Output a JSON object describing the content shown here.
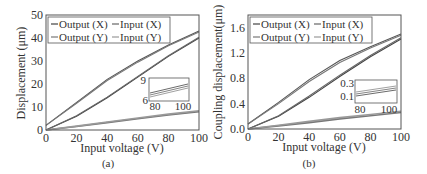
{
  "chart_data": [
    {
      "type": "line",
      "panel_label": "(a)",
      "title": "",
      "xlabel": "Input voltage (V)",
      "ylabel": "Displacement (μm)",
      "xlim": [
        0,
        100
      ],
      "ylim": [
        0,
        50
      ],
      "xticks": [
        "0",
        "20",
        "40",
        "60",
        "80",
        "100"
      ],
      "yticks": [
        "0",
        "10",
        "20",
        "30",
        "40",
        "50"
      ],
      "legend": {
        "position": "upper left",
        "entries": [
          "Output (X)",
          "Input (X)",
          "Output (Y)",
          "Input (Y)"
        ]
      },
      "series": [
        {
          "name": "Output (X) ascending",
          "x": [
            0,
            20,
            40,
            60,
            80,
            100
          ],
          "values": [
            0,
            6,
            14,
            23,
            32,
            40
          ]
        },
        {
          "name": "Output (X) descending",
          "x": [
            0,
            20,
            40,
            60,
            80,
            100
          ],
          "values": [
            2,
            12,
            22,
            30,
            37,
            43
          ]
        },
        {
          "name": "Input (X) ascending",
          "x": [
            0,
            20,
            40,
            60,
            80,
            100
          ],
          "values": [
            0,
            6.2,
            14.3,
            23.3,
            32.3,
            40.3
          ]
        },
        {
          "name": "Input (X) descending",
          "x": [
            0,
            20,
            40,
            60,
            80,
            100
          ],
          "values": [
            2,
            11.6,
            21.5,
            29.5,
            36.6,
            42.6
          ]
        },
        {
          "name": "Output (Y)",
          "x": [
            0,
            20,
            40,
            60,
            80,
            100
          ],
          "values": [
            0,
            1.5,
            3.2,
            4.9,
            6.5,
            8
          ]
        },
        {
          "name": "Input (Y)",
          "x": [
            0,
            20,
            40,
            60,
            80,
            100
          ],
          "values": [
            0,
            1.7,
            3.5,
            5.2,
            6.9,
            8.4
          ]
        }
      ],
      "inset": {
        "xlim": [
          80,
          100
        ],
        "ylim": [
          6,
          9
        ],
        "xticks": [
          "80",
          "100"
        ],
        "yticks": [
          "6",
          "9"
        ]
      }
    },
    {
      "type": "line",
      "panel_label": "(b)",
      "title": "",
      "xlabel": "Input voltage (V)",
      "ylabel": "Coupling displacement(μm)",
      "xlim": [
        0,
        100
      ],
      "ylim": [
        0,
        1.8
      ],
      "xticks": [
        "0",
        "20",
        "40",
        "60",
        "80",
        "100"
      ],
      "yticks": [
        "0.0",
        "0.4",
        "0.8",
        "1.2",
        "1.6"
      ],
      "legend": {
        "position": "upper left",
        "entries": [
          "Output (X)",
          "Input (X)",
          "Output (Y)",
          "Input (Y)"
        ]
      },
      "series": [
        {
          "name": "Output (X) ascending",
          "x": [
            0,
            20,
            40,
            60,
            80,
            100
          ],
          "values": [
            0,
            0.2,
            0.5,
            0.83,
            1.14,
            1.42
          ]
        },
        {
          "name": "Output (X) descending",
          "x": [
            0,
            20,
            40,
            60,
            80,
            100
          ],
          "values": [
            0.08,
            0.42,
            0.78,
            1.08,
            1.3,
            1.5
          ]
        },
        {
          "name": "Input (X) ascending",
          "x": [
            0,
            20,
            40,
            60,
            80,
            100
          ],
          "values": [
            0,
            0.21,
            0.52,
            0.85,
            1.16,
            1.44
          ]
        },
        {
          "name": "Input (X) descending",
          "x": [
            0,
            20,
            40,
            60,
            80,
            100
          ],
          "values": [
            0.08,
            0.4,
            0.75,
            1.05,
            1.28,
            1.48
          ]
        },
        {
          "name": "Output (Y)",
          "x": [
            0,
            20,
            40,
            60,
            80,
            100
          ],
          "values": [
            0,
            0.05,
            0.1,
            0.16,
            0.21,
            0.26
          ]
        },
        {
          "name": "Input (Y)",
          "x": [
            0,
            20,
            40,
            60,
            80,
            100
          ],
          "values": [
            0,
            0.06,
            0.12,
            0.18,
            0.23,
            0.28
          ]
        }
      ],
      "inset": {
        "xlim": [
          80,
          100
        ],
        "ylim": [
          0.1,
          0.3
        ],
        "xticks": [
          "80",
          "100"
        ],
        "yticks": [
          "0.1",
          "0.3"
        ]
      }
    }
  ],
  "colors": {
    "axis": "#555555",
    "line_dark": "#444444",
    "line_mid": "#666666",
    "line_light": "#888888",
    "text": "#333333"
  }
}
